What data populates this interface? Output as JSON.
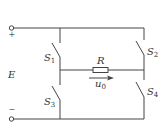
{
  "diagram": {
    "type": "full-bridge switching circuit",
    "colors": {
      "wire": "#444444",
      "text": "#333333",
      "background": "#ffffff"
    },
    "source": {
      "label": "E",
      "positive_sign": "+",
      "negative_sign": "−"
    },
    "switches": [
      {
        "id": "S1",
        "letter": "S",
        "index": "1",
        "position": "upper-left"
      },
      {
        "id": "S2",
        "letter": "S",
        "index": "2",
        "position": "upper-right"
      },
      {
        "id": "S3",
        "letter": "S",
        "index": "3",
        "position": "lower-left"
      },
      {
        "id": "S4",
        "letter": "S",
        "index": "4",
        "position": "lower-right"
      }
    ],
    "load": {
      "label": "R"
    },
    "output_voltage": {
      "letter": "u",
      "index": "0",
      "direction": "left-to-right"
    }
  }
}
